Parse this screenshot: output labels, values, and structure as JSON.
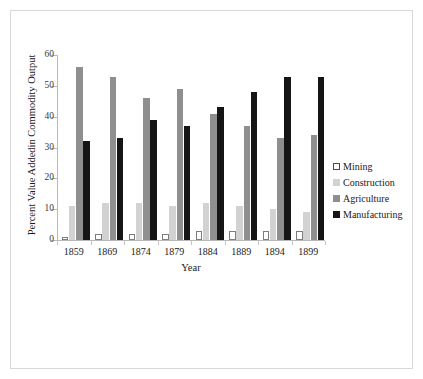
{
  "chart_data": {
    "type": "bar",
    "title": "",
    "subtitle": "",
    "xlabel": "Year",
    "ylabel": "Percent Value Addedin Commodity Output",
    "categories": [
      "1859",
      "1869",
      "1874",
      "1879",
      "1884",
      "1889",
      "1894",
      "1899"
    ],
    "ylim": [
      0,
      60
    ],
    "yticks": [
      0,
      10,
      20,
      30,
      40,
      50,
      60
    ],
    "ytick_labels": [
      "0",
      "10",
      "20",
      "30",
      "40",
      "50",
      "60"
    ],
    "grid": false,
    "legend_position": "right",
    "series": [
      {
        "name": "Mining",
        "color": "#ffffff",
        "edge_color": "#7d7d7d",
        "values": [
          1,
          2,
          2,
          2,
          3,
          3,
          3,
          3
        ]
      },
      {
        "name": "Construction",
        "color": "#d2d2d2",
        "values": [
          11,
          12,
          12,
          11,
          12,
          11,
          10,
          9
        ]
      },
      {
        "name": "Agriculture",
        "color": "#8f8f8f",
        "values": [
          56,
          53,
          46,
          49,
          41,
          37,
          33,
          34
        ]
      },
      {
        "name": "Manufacturing",
        "color": "#151515",
        "values": [
          32,
          33,
          39,
          37,
          43,
          48,
          53,
          53
        ]
      }
    ]
  },
  "legend": {
    "items": [
      {
        "label": "Mining",
        "key": "mining"
      },
      {
        "label": "Construction",
        "key": "construction"
      },
      {
        "label": "Agriculture",
        "key": "agriculture"
      },
      {
        "label": "Manufacturing",
        "key": "manufacturing"
      }
    ]
  },
  "colors": {
    "mining": "#ffffff",
    "mining_edge": "#7d7d7d",
    "construction": "#d2d2d2",
    "agriculture": "#8f8f8f",
    "manufacturing": "#151515",
    "axis": "#b9b9b9",
    "frame": "#d8d8d8",
    "text": "#1a1a1a"
  }
}
